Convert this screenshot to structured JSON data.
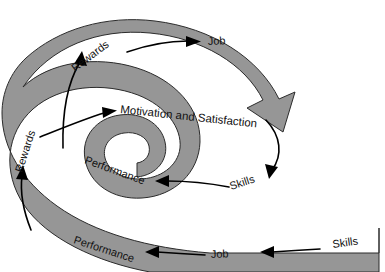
{
  "diagram": {
    "type": "spiral-cycle-diagram",
    "colors": {
      "band_fill": "#969696",
      "band_stroke": "#2b2b2b",
      "text": "#111111",
      "arrow": "#000000",
      "background": "#ffffff"
    },
    "labels": {
      "rewards_outer": "Rewards",
      "job_top": "Job",
      "motivation_satisfaction": "Motivation and Satisfaction",
      "rewards_inner": "Rewards",
      "performance_middle": "Performance",
      "skills_middle": "Skills",
      "performance_bottom": "Performance",
      "job_bottom": "Job",
      "skills_bottom": "Skills"
    },
    "sequence": [
      "Skills",
      "Job",
      "Performance",
      "Rewards",
      "Motivation and Satisfaction",
      "Skills",
      "Performance",
      "Rewards",
      "Job"
    ]
  }
}
